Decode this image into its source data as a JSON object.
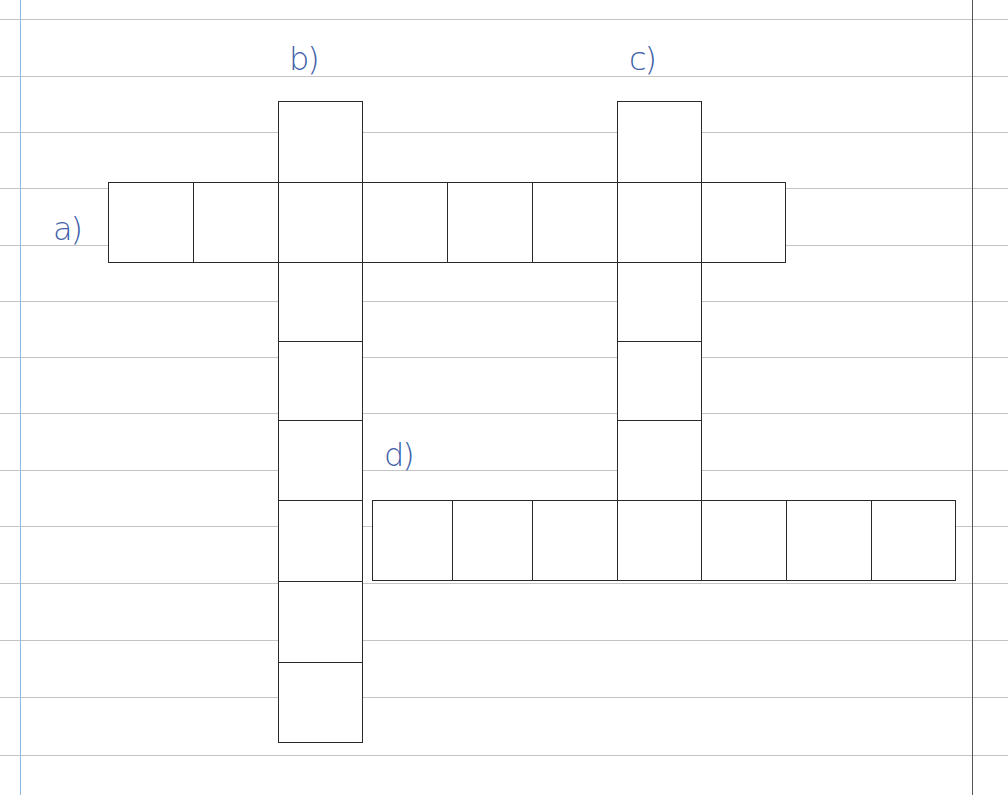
{
  "page": {
    "type": "crossword-worksheet",
    "paper": "lined",
    "colors": {
      "ink": "#3e5fa8",
      "grid": "#2a2a2a",
      "rule": "#c4c4c4",
      "margin": "#8fb9dd"
    }
  },
  "clues": [
    {
      "id": "a",
      "label": "a)",
      "direction": "across",
      "length": 8
    },
    {
      "id": "b",
      "label": "b)",
      "direction": "down",
      "length": 8
    },
    {
      "id": "c",
      "label": "c)",
      "direction": "down",
      "length": 5
    },
    {
      "id": "d",
      "label": "d)",
      "direction": "across",
      "length": 7
    }
  ]
}
